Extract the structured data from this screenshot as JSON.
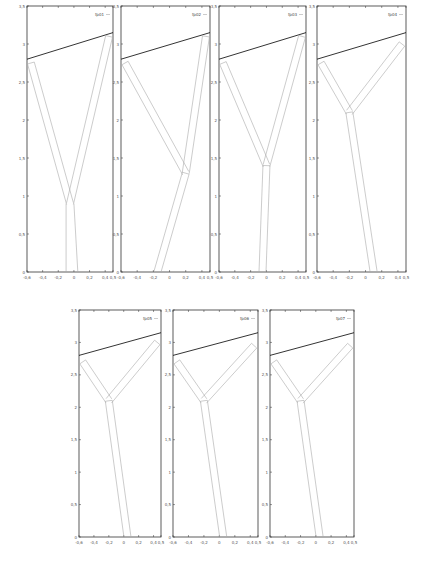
{
  "figure": {
    "panel_count": 7,
    "line_color": "#000000",
    "branch_color": "#aaaaaa",
    "frame_color": "#333333"
  },
  "chart_data": [
    {
      "type": "line",
      "legend": "fp01",
      "xlim": [
        -0.6,
        0.5
      ],
      "ylim": [
        0,
        3.5
      ],
      "xticks": [
        "-0,6",
        "-0,4",
        "-0,2",
        "0",
        "0,2",
        "0,4",
        "0,5"
      ],
      "yticks": [
        "0",
        "0,5",
        "1",
        "1,5",
        "2",
        "2,5",
        "3",
        "3,5"
      ],
      "grid": false,
      "legend_position": "top-right",
      "series": [
        {
          "name": "ceiling-line",
          "x": [
            -0.6,
            0.5
          ],
          "y": [
            2.8,
            3.15
          ]
        },
        {
          "name": "trunk",
          "x": [
            -0.1,
            -0.05,
            0.05
          ],
          "y": [
            0,
            0.9,
            0
          ]
        },
        {
          "name": "left-branch",
          "x": [
            -0.05,
            -0.55
          ],
          "y": [
            0.9,
            2.75
          ]
        },
        {
          "name": "right-branch",
          "x": [
            -0.05,
            0.45
          ],
          "y": [
            0.9,
            3.1
          ]
        }
      ]
    },
    {
      "type": "line",
      "legend": "fp02",
      "xlim": [
        -0.6,
        0.5
      ],
      "ylim": [
        0,
        3.5
      ],
      "xticks": [
        "-0,6",
        "-0,4",
        "-0,2",
        "0",
        "0,2",
        "0,4",
        "0,5"
      ],
      "yticks": [
        "0",
        "0,5",
        "1",
        "1,5",
        "2",
        "2,5",
        "3",
        "3,5"
      ],
      "grid": false,
      "legend_position": "top-right",
      "series": [
        {
          "name": "ceiling-line",
          "x": [
            -0.6,
            0.5
          ],
          "y": [
            2.8,
            3.15
          ]
        },
        {
          "name": "trunk",
          "x": [
            -0.15,
            0.2
          ],
          "y": [
            0,
            1.3
          ]
        },
        {
          "name": "left-branch",
          "x": [
            0.2,
            -0.55
          ],
          "y": [
            1.3,
            2.75
          ]
        },
        {
          "name": "right-branch",
          "x": [
            0.2,
            0.45
          ],
          "y": [
            1.3,
            3.1
          ]
        }
      ]
    },
    {
      "type": "line",
      "legend": "fp03",
      "xlim": [
        -0.6,
        0.5
      ],
      "ylim": [
        0,
        3.5
      ],
      "xticks": [
        "-0,6",
        "-0,4",
        "-0,2",
        "0",
        "0,2",
        "0,4",
        "0,5"
      ],
      "yticks": [
        "0",
        "0,5",
        "1",
        "1,5",
        "2",
        "2,5",
        "3",
        "3,5"
      ],
      "grid": false,
      "legend_position": "top-right",
      "series": [
        {
          "name": "ceiling-line",
          "x": [
            -0.6,
            0.5
          ],
          "y": [
            2.8,
            3.15
          ]
        },
        {
          "name": "trunk",
          "x": [
            -0.05,
            0.0
          ],
          "y": [
            0,
            1.4
          ]
        },
        {
          "name": "left-branch",
          "x": [
            0.0,
            -0.55
          ],
          "y": [
            1.4,
            2.75
          ]
        },
        {
          "name": "right-branch",
          "x": [
            0.0,
            0.45
          ],
          "y": [
            1.4,
            3.1
          ]
        }
      ]
    },
    {
      "type": "line",
      "legend": "fp04",
      "xlim": [
        -0.6,
        0.5
      ],
      "ylim": [
        0,
        3.5
      ],
      "xticks": [
        "-0,6",
        "-0,4",
        "-0,2",
        "0",
        "0,2",
        "0,4",
        "0,5"
      ],
      "yticks": [
        "0",
        "0,5",
        "1",
        "1,5",
        "2",
        "2,5",
        "3",
        "3,5"
      ],
      "grid": false,
      "legend_position": "top-right",
      "series": [
        {
          "name": "ceiling-line",
          "x": [
            -0.6,
            0.5
          ],
          "y": [
            2.8,
            3.15
          ]
        },
        {
          "name": "trunk",
          "x": [
            0.1,
            -0.2
          ],
          "y": [
            0,
            2.1
          ]
        },
        {
          "name": "left-branch",
          "x": [
            -0.2,
            -0.55
          ],
          "y": [
            2.1,
            2.75
          ]
        },
        {
          "name": "right-branch",
          "x": [
            -0.2,
            0.45
          ],
          "y": [
            2.1,
            3.0
          ]
        }
      ]
    },
    {
      "type": "line",
      "legend": "fp05",
      "xlim": [
        -0.6,
        0.5
      ],
      "ylim": [
        0,
        3.5
      ],
      "xticks": [
        "-0,6",
        "-0,4",
        "-0,2",
        "0",
        "0,2",
        "0,4",
        "0,5"
      ],
      "yticks": [
        "0",
        "0,5",
        "1",
        "1,5",
        "2",
        "2,5",
        "3",
        "3,5"
      ],
      "grid": false,
      "legend_position": "top-right",
      "series": [
        {
          "name": "ceiling-line",
          "x": [
            -0.6,
            0.5
          ],
          "y": [
            2.8,
            3.15
          ]
        },
        {
          "name": "trunk",
          "x": [
            0.05,
            -0.2
          ],
          "y": [
            0,
            2.1
          ]
        },
        {
          "name": "left-branch",
          "x": [
            -0.2,
            -0.55
          ],
          "y": [
            2.1,
            2.7
          ]
        },
        {
          "name": "right-branch",
          "x": [
            -0.2,
            0.45
          ],
          "y": [
            2.1,
            3.0
          ]
        }
      ]
    },
    {
      "type": "line",
      "legend": "fp06",
      "xlim": [
        -0.6,
        0.5
      ],
      "ylim": [
        0,
        3.5
      ],
      "xticks": [
        "-0,6",
        "-0,4",
        "-0,2",
        "0",
        "0,2",
        "0,4",
        "0,5"
      ],
      "yticks": [
        "0",
        "0,5",
        "1",
        "1,5",
        "2",
        "2,5",
        "3",
        "3,5"
      ],
      "grid": false,
      "legend_position": "top-right",
      "series": [
        {
          "name": "ceiling-line",
          "x": [
            -0.6,
            0.5
          ],
          "y": [
            2.8,
            3.15
          ]
        },
        {
          "name": "trunk",
          "x": [
            0.05,
            -0.2
          ],
          "y": [
            0,
            2.1
          ]
        },
        {
          "name": "left-branch",
          "x": [
            -0.2,
            -0.55
          ],
          "y": [
            2.1,
            2.7
          ]
        },
        {
          "name": "right-branch",
          "x": [
            -0.2,
            0.45
          ],
          "y": [
            2.1,
            2.95
          ]
        }
      ]
    },
    {
      "type": "line",
      "legend": "fp07",
      "xlim": [
        -0.6,
        0.5
      ],
      "ylim": [
        0,
        3.5
      ],
      "xticks": [
        "-0,6",
        "-0,4",
        "-0,2",
        "0",
        "0,2",
        "0,4",
        "0,5"
      ],
      "yticks": [
        "0",
        "0,5",
        "1",
        "1,5",
        "2",
        "2,5",
        "3",
        "3,5"
      ],
      "grid": false,
      "legend_position": "top-right",
      "series": [
        {
          "name": "ceiling-line",
          "x": [
            -0.6,
            0.5
          ],
          "y": [
            2.8,
            3.15
          ]
        },
        {
          "name": "trunk",
          "x": [
            0.05,
            -0.2
          ],
          "y": [
            0,
            2.1
          ]
        },
        {
          "name": "left-branch",
          "x": [
            -0.2,
            -0.55
          ],
          "y": [
            2.1,
            2.7
          ]
        },
        {
          "name": "right-branch",
          "x": [
            -0.2,
            0.45
          ],
          "y": [
            2.1,
            2.95
          ]
        }
      ]
    }
  ],
  "layout": [
    {
      "left": 27,
      "top": 6,
      "width": 86,
      "height": 266
    },
    {
      "left": 121,
      "top": 6,
      "width": 89,
      "height": 266
    },
    {
      "left": 219,
      "top": 6,
      "width": 87,
      "height": 266
    },
    {
      "left": 317,
      "top": 6,
      "width": 89,
      "height": 266
    },
    {
      "left": 79,
      "top": 310,
      "width": 82,
      "height": 227
    },
    {
      "left": 173,
      "top": 310,
      "width": 85,
      "height": 227
    },
    {
      "left": 270,
      "top": 310,
      "width": 84,
      "height": 227
    }
  ]
}
